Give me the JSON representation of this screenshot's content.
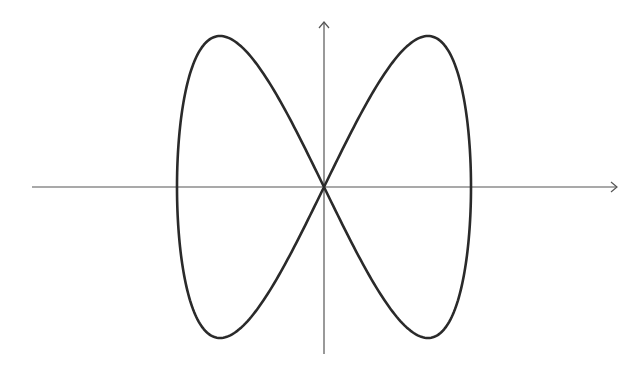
{
  "figure": {
    "type": "parametric-curve",
    "curve": {
      "x_expr": "sin(t)",
      "y_expr": "sin(2t)",
      "t_range": [
        0,
        6.283185307
      ],
      "samples": 400,
      "stroke": "#2a2a2a",
      "stroke_width": 2.6
    },
    "axes": {
      "color": "#555555",
      "stroke_width": 1.2,
      "origin_px": [
        324,
        187
      ],
      "x_axis": {
        "from_px": 32,
        "to_px": 617,
        "arrow": "right"
      },
      "y_axis": {
        "from_px": 354,
        "to_px": 22,
        "arrow": "up"
      },
      "x_label": "",
      "y_label": ""
    },
    "scale_px": {
      "x_amplitude": 147,
      "y_amplitude": 151
    },
    "background": "#ffffff"
  }
}
